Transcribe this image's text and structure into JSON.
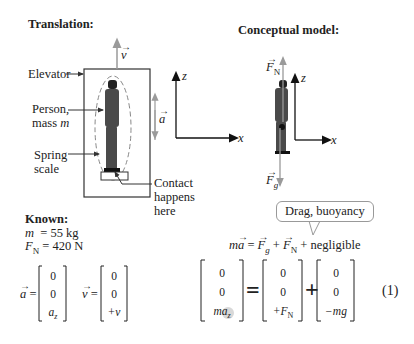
{
  "translation": {
    "title": "Translation:",
    "labels": {
      "elevator": "Elevator",
      "person_line1": "Person,",
      "person_line2": "mass",
      "person_var": "m",
      "spring_line1": "Spring",
      "spring_line2": "scale",
      "contact_line1": "Contact",
      "contact_line2": "happens",
      "contact_line3": "here",
      "velocity": "v",
      "acceleration": "a",
      "axis_z": "z",
      "axis_x": "x"
    }
  },
  "conceptual_model": {
    "title": "Conceptual model:",
    "labels": {
      "normal_force": "F",
      "normal_sub": "N",
      "gravity_force": "F",
      "gravity_sub": "g",
      "axis_z": "z",
      "axis_x": "x"
    }
  },
  "known": {
    "title": "Known:",
    "mass_var": "m",
    "mass_value": "= 55 kg",
    "force_var": "F",
    "force_sub": "N",
    "force_value": "= 420 N",
    "a_vector": {
      "name": "a",
      "eq": "=",
      "components": [
        "0",
        "0",
        "a"
      ],
      "last_sub": "z"
    },
    "v_vector": {
      "name": "v",
      "eq": "=",
      "components": [
        "0",
        "0",
        "+v"
      ]
    }
  },
  "equation": {
    "callout": "Drag, buoyancy",
    "law_lhs": "ma",
    "law_rhs_parts": [
      "= ",
      "F",
      "g",
      " + ",
      "F",
      "N",
      " + negligible"
    ],
    "lhs_vector": [
      "0",
      "0",
      "ma"
    ],
    "lhs_last_sub": "z",
    "equals": "=",
    "fn_vector": [
      "0",
      "0",
      "+F"
    ],
    "fn_last_sub": "N",
    "plus": "+",
    "fg_vector": [
      "0",
      "0",
      "−mg"
    ],
    "number": "(1)"
  },
  "colors": {
    "arrow_gray": "#9a9a9a",
    "ink": "#222222",
    "person": "#4a4a4a",
    "dashed": "#888888",
    "highlight": "#d8d8d8"
  }
}
